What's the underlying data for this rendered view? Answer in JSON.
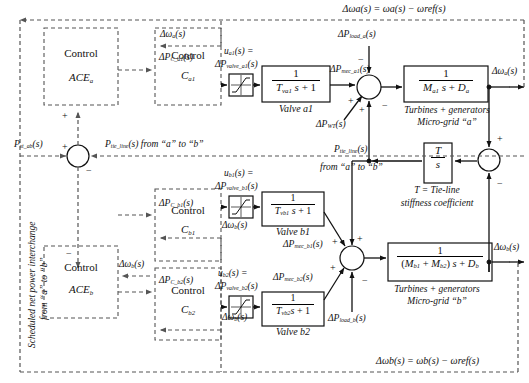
{
  "diagram": {
    "equations": {
      "top": "Δωa(s) = ωa(s) − ωref(s)",
      "bottom": "Δωb(s) = ωb(s) − ωref(s)"
    },
    "blocks": {
      "control_ace_a": {
        "line1": "Control",
        "line2": "ACEa"
      },
      "control_ace_b": {
        "line1": "Control",
        "line2": "ACEb"
      },
      "control_ca1": {
        "line1": "Control",
        "line2": "Ca1"
      },
      "control_cb1": {
        "line1": "Control",
        "line2": "Cb1"
      },
      "control_cb2": {
        "line1": "Control",
        "line2": "Cb2"
      },
      "valve_a1": {
        "num": "1",
        "den_T": "Tva1",
        "den_rest": "s + 1",
        "caption": "Valve a1"
      },
      "valve_b1": {
        "num": "1",
        "den_T": "Tvb1",
        "den_rest": "s + 1",
        "caption": "Valve b1"
      },
      "valve_b2": {
        "num": "1",
        "den_T": "Tvb2",
        "den_rest": "s + 1",
        "caption": "Valve b2"
      },
      "grid_a": {
        "num": "1",
        "den_M": "Ma1",
        "den_rest": "s + Da",
        "caption1": "Turbines + generators",
        "caption2": "Micro-grid “a”"
      },
      "grid_b": {
        "num": "1",
        "den_M": "(Mb1 + Mb2)",
        "den_rest": "s + Db",
        "caption1": "Turbines + generators",
        "caption2": "Micro-grid “b”"
      },
      "tie_line": {
        "num": "T",
        "den": "s",
        "caption1": "T = Tie-line",
        "caption2": "stiffness coefficient"
      },
      "limiter_a1": {
        "icon": "saturation-icon"
      },
      "limiter_b1": {
        "icon": "saturation-icon"
      },
      "limiter_b2": {
        "icon": "saturation-icon"
      }
    },
    "signals": {
      "dw_a_fb_ace": "Δωa(s)",
      "dpc_a1": "ΔPC_a1(s)",
      "u_a1_line1": "ua1(s) =",
      "u_a1_line2": "ΔPvalve_a1(s)",
      "dp_mec_a1": "ΔPmec_a1(s)",
      "dp_load_a": "ΔPload_a(s)",
      "dp_wt": "ΔPWT(s)",
      "dw_a_out": "Δωa(s)",
      "p_tie_line_mid_1": "Ptie_line(s)",
      "p_tie_line_mid_2": "from “a” to “b”",
      "p_st_ab": "Pst_ab(s)",
      "p_tie_line_top": "Ptie_line(s) from “a” to “b”",
      "dpc_b1": "ΔPC_b1(s)",
      "dpc_b2": "ΔPC_b2(s)",
      "dw_b_fb_cb1": "Δωb(s)",
      "dw_b_fb_ace": "Δωb(s)",
      "dw_b_fb_cb2": "Δωb(s)",
      "u_b1_line1": "ub1(s) =",
      "u_b1_line2": "ΔPvalve_b1(s)",
      "u_b2_line1": "ub2(s) =",
      "u_b2_line2": "ΔPvalve_b2(s)",
      "dp_mec_b1": "ΔPmec_b1(s)",
      "dp_mec_b2": "ΔPmec_b2(s)",
      "dp_load_b": "ΔPload_b(s)",
      "dw_b_out": "Δωb(s)",
      "scheduled_note_1": "Scheduled net power interchange",
      "scheduled_note_2": "from “a” to “b”"
    },
    "signs": {
      "plus": "+",
      "minus": "−"
    },
    "colors": {
      "line": "#1a1a1a",
      "dashed": "#555555",
      "background": "#ffffff"
    }
  }
}
